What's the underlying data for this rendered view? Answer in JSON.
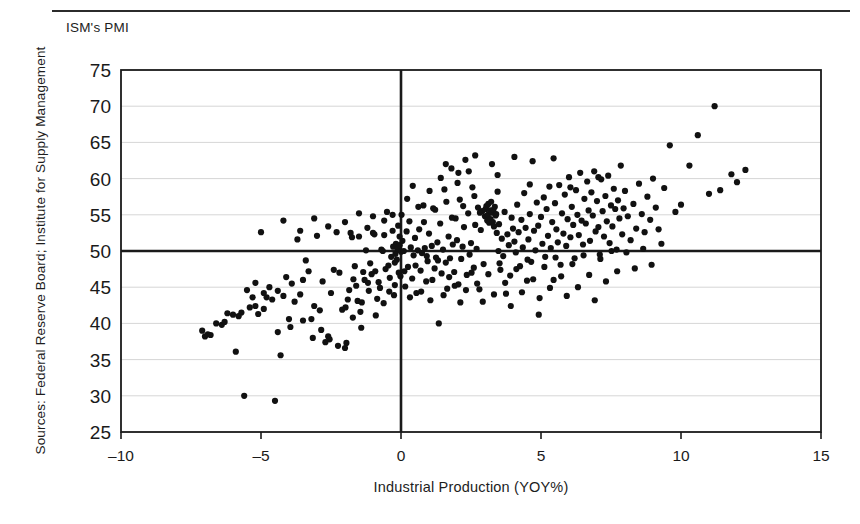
{
  "figure": {
    "y_axis_unit_label": "ISM's PMI",
    "source_note": "Sources: Federal Reserve Board; Institute for Supply Management",
    "ink_color": "#1a1a1a",
    "grid_color": "#d6d6d6",
    "point_color": "#111111"
  },
  "chart_data": {
    "type": "scatter",
    "title": "",
    "xlabel": "Industrial Production (YOY%)",
    "ylabel": "ISM's PMI",
    "xlim": [
      -10,
      15
    ],
    "ylim": [
      25,
      75
    ],
    "xticks": [
      -10,
      -5,
      0,
      5,
      10,
      15
    ],
    "xtick_labels": [
      "–10",
      "–5",
      "0",
      "5",
      "10",
      "15"
    ],
    "yticks": [
      25,
      30,
      35,
      40,
      45,
      50,
      55,
      60,
      65,
      70,
      75
    ],
    "ytick_labels": [
      "25",
      "30",
      "35",
      "40",
      "45",
      "50",
      "55",
      "60",
      "65",
      "70",
      "75"
    ],
    "grid": true,
    "grid_axis": "y",
    "legend": false,
    "reference_lines": [
      {
        "axis": "y",
        "value": 50,
        "style": "thick",
        "label": "PMI = 50 expansion threshold"
      },
      {
        "axis": "x",
        "value": 0,
        "style": "thick",
        "label": "Zero industrial production growth"
      }
    ],
    "marker": "filled-circle",
    "marker_size_px": 5,
    "n_points": 372,
    "points": [
      [
        -7.1,
        39.0
      ],
      [
        -7.0,
        38.2
      ],
      [
        -6.9,
        38.5
      ],
      [
        -6.6,
        40.0
      ],
      [
        -6.4,
        39.8
      ],
      [
        -6.2,
        41.4
      ],
      [
        -6.0,
        41.2
      ],
      [
        -5.9,
        36.1
      ],
      [
        -5.7,
        41.5
      ],
      [
        -5.6,
        30.0
      ],
      [
        -5.5,
        44.6
      ],
      [
        -5.4,
        42.2
      ],
      [
        -5.3,
        43.6
      ],
      [
        -5.2,
        45.6
      ],
      [
        -5.1,
        41.3
      ],
      [
        -5.0,
        52.6
      ],
      [
        -4.9,
        42.0
      ],
      [
        -4.8,
        43.6
      ],
      [
        -4.7,
        45.0
      ],
      [
        -4.6,
        43.3
      ],
      [
        -4.5,
        29.3
      ],
      [
        -4.4,
        44.5
      ],
      [
        -4.3,
        35.6
      ],
      [
        -4.2,
        43.8
      ],
      [
        -4.1,
        46.4
      ],
      [
        -4.0,
        40.6
      ],
      [
        -3.9,
        45.5
      ],
      [
        -3.8,
        43.0
      ],
      [
        -3.7,
        51.6
      ],
      [
        -3.6,
        44.0
      ],
      [
        -3.5,
        46.0
      ],
      [
        -3.4,
        48.7
      ],
      [
        -3.3,
        47.2
      ],
      [
        -3.2,
        40.6
      ],
      [
        -3.1,
        42.4
      ],
      [
        -3.0,
        52.1
      ],
      [
        -2.9,
        41.8
      ],
      [
        -2.8,
        45.8
      ],
      [
        -2.7,
        37.4
      ],
      [
        -2.6,
        38.2
      ],
      [
        -2.5,
        44.2
      ],
      [
        -2.4,
        47.4
      ],
      [
        -2.3,
        52.6
      ],
      [
        -2.2,
        47.0
      ],
      [
        -2.1,
        41.9
      ],
      [
        -2.0,
        36.6
      ],
      [
        -1.95,
        37.3
      ],
      [
        -1.9,
        43.3
      ],
      [
        -1.85,
        44.6
      ],
      [
        -1.8,
        52.5
      ],
      [
        -1.75,
        51.9
      ],
      [
        -1.7,
        46.1
      ],
      [
        -1.65,
        47.9
      ],
      [
        -1.6,
        45.2
      ],
      [
        -1.55,
        43.1
      ],
      [
        -1.5,
        52.0
      ],
      [
        -1.45,
        41.6
      ],
      [
        -1.4,
        42.9
      ],
      [
        -1.35,
        47.1
      ],
      [
        -1.3,
        46.0
      ],
      [
        -1.25,
        50.1
      ],
      [
        -1.2,
        53.2
      ],
      [
        -1.15,
        44.5
      ],
      [
        -1.1,
        48.3
      ],
      [
        -1.05,
        46.8
      ],
      [
        -1.0,
        52.5
      ],
      [
        -0.95,
        52.3
      ],
      [
        -0.9,
        41.1
      ],
      [
        -0.85,
        43.4
      ],
      [
        -0.8,
        45.7
      ],
      [
        -0.75,
        44.9
      ],
      [
        -0.7,
        50.2
      ],
      [
        -0.65,
        50.0
      ],
      [
        -0.6,
        52.2
      ],
      [
        -0.55,
        47.5
      ],
      [
        -0.5,
        55.4
      ],
      [
        -0.45,
        48.0
      ],
      [
        -0.4,
        46.3
      ],
      [
        -0.35,
        49.2
      ],
      [
        -0.3,
        52.8
      ],
      [
        -0.28,
        50.6
      ],
      [
        -0.25,
        43.9
      ],
      [
        -0.22,
        45.3
      ],
      [
        -0.2,
        49.6
      ],
      [
        -0.18,
        51.0
      ],
      [
        -0.15,
        48.8
      ],
      [
        -0.12,
        50.3
      ],
      [
        -0.1,
        53.5
      ],
      [
        -0.08,
        47.0
      ],
      [
        -0.05,
        50.8
      ],
      [
        -0.02,
        46.5
      ],
      [
        0.0,
        49.9
      ],
      [
        0.05,
        51.4
      ],
      [
        0.1,
        50.0
      ],
      [
        0.15,
        45.1
      ],
      [
        0.2,
        52.7
      ],
      [
        0.25,
        47.8
      ],
      [
        0.3,
        54.1
      ],
      [
        0.35,
        50.5
      ],
      [
        0.4,
        46.2
      ],
      [
        0.45,
        49.4
      ],
      [
        0.5,
        51.8
      ],
      [
        0.55,
        44.2
      ],
      [
        0.6,
        50.1
      ],
      [
        0.65,
        53.0
      ],
      [
        0.7,
        47.3
      ],
      [
        0.75,
        49.7
      ],
      [
        0.8,
        56.3
      ],
      [
        0.85,
        50.4
      ],
      [
        0.9,
        45.8
      ],
      [
        0.95,
        48.6
      ],
      [
        1.0,
        52.4
      ],
      [
        1.05,
        43.2
      ],
      [
        1.1,
        50.7
      ],
      [
        1.15,
        55.9
      ],
      [
        1.2,
        47.6
      ],
      [
        1.25,
        49.1
      ],
      [
        1.3,
        51.2
      ],
      [
        1.35,
        40.0
      ],
      [
        1.4,
        53.8
      ],
      [
        1.45,
        46.9
      ],
      [
        1.5,
        50.2
      ],
      [
        1.55,
        58.5
      ],
      [
        1.6,
        48.4
      ],
      [
        1.65,
        44.8
      ],
      [
        1.7,
        52.0
      ],
      [
        1.75,
        49.0
      ],
      [
        1.8,
        61.4
      ],
      [
        1.85,
        50.9
      ],
      [
        1.9,
        47.1
      ],
      [
        1.95,
        54.5
      ],
      [
        2.0,
        51.5
      ],
      [
        2.05,
        45.4
      ],
      [
        2.1,
        57.1
      ],
      [
        2.15,
        48.9
      ],
      [
        2.2,
        50.6
      ],
      [
        2.25,
        53.3
      ],
      [
        2.3,
        62.6
      ],
      [
        2.35,
        46.7
      ],
      [
        2.4,
        55.2
      ],
      [
        2.45,
        49.5
      ],
      [
        2.5,
        51.1
      ],
      [
        2.55,
        58.8
      ],
      [
        2.6,
        47.7
      ],
      [
        2.65,
        53.6
      ],
      [
        2.7,
        50.3
      ],
      [
        2.75,
        56.0
      ],
      [
        2.8,
        44.7
      ],
      [
        2.85,
        52.9
      ],
      [
        2.9,
        55.5
      ],
      [
        2.95,
        48.2
      ],
      [
        3.0,
        54.8
      ],
      [
        3.02,
        55.8
      ],
      [
        3.05,
        56.2
      ],
      [
        3.08,
        54.2
      ],
      [
        3.1,
        55.0
      ],
      [
        3.12,
        56.5
      ],
      [
        3.15,
        53.9
      ],
      [
        3.18,
        55.6
      ],
      [
        3.2,
        54.4
      ],
      [
        3.22,
        56.8
      ],
      [
        3.25,
        55.3
      ],
      [
        3.28,
        54.0
      ],
      [
        3.3,
        55.7
      ],
      [
        3.32,
        53.4
      ],
      [
        3.35,
        56.1
      ],
      [
        3.38,
        54.9
      ],
      [
        3.4,
        55.1
      ],
      [
        3.42,
        52.5
      ],
      [
        3.45,
        58.2
      ],
      [
        3.48,
        50.0
      ],
      [
        3.5,
        53.7
      ],
      [
        3.55,
        47.4
      ],
      [
        3.6,
        51.7
      ],
      [
        3.65,
        49.3
      ],
      [
        3.7,
        55.4
      ],
      [
        3.75,
        44.1
      ],
      [
        3.8,
        52.3
      ],
      [
        3.85,
        50.8
      ],
      [
        3.9,
        46.6
      ],
      [
        3.95,
        54.6
      ],
      [
        4.0,
        53.1
      ],
      [
        4.05,
        51.3
      ],
      [
        4.1,
        49.8
      ],
      [
        4.15,
        56.4
      ],
      [
        4.2,
        52.6
      ],
      [
        4.25,
        47.9
      ],
      [
        4.3,
        54.3
      ],
      [
        4.35,
        50.5
      ],
      [
        4.4,
        58.0
      ],
      [
        4.45,
        53.2
      ],
      [
        4.5,
        45.9
      ],
      [
        4.55,
        51.6
      ],
      [
        4.6,
        55.1
      ],
      [
        4.65,
        48.5
      ],
      [
        4.7,
        62.4
      ],
      [
        4.75,
        52.8
      ],
      [
        4.8,
        50.1
      ],
      [
        4.85,
        56.7
      ],
      [
        4.9,
        53.5
      ],
      [
        4.95,
        43.5
      ],
      [
        5.0,
        54.7
      ],
      [
        5.05,
        51.0
      ],
      [
        5.1,
        57.4
      ],
      [
        5.15,
        49.2
      ],
      [
        5.2,
        55.8
      ],
      [
        5.25,
        52.1
      ],
      [
        5.3,
        58.9
      ],
      [
        5.35,
        50.4
      ],
      [
        5.4,
        54.0
      ],
      [
        5.45,
        46.0
      ],
      [
        5.5,
        56.6
      ],
      [
        5.55,
        53.0
      ],
      [
        5.6,
        51.2
      ],
      [
        5.65,
        59.1
      ],
      [
        5.7,
        48.1
      ],
      [
        5.75,
        55.2
      ],
      [
        5.8,
        52.4
      ],
      [
        5.85,
        57.8
      ],
      [
        5.9,
        50.7
      ],
      [
        5.95,
        54.4
      ],
      [
        6.0,
        60.2
      ],
      [
        6.05,
        51.9
      ],
      [
        6.1,
        56.1
      ],
      [
        6.15,
        53.6
      ],
      [
        6.2,
        49.0
      ],
      [
        6.25,
        58.4
      ],
      [
        6.3,
        55.0
      ],
      [
        6.35,
        52.2
      ],
      [
        6.4,
        60.8
      ],
      [
        6.45,
        54.2
      ],
      [
        6.5,
        50.9
      ],
      [
        6.55,
        57.2
      ],
      [
        6.6,
        53.8
      ],
      [
        6.65,
        59.6
      ],
      [
        6.7,
        55.6
      ],
      [
        6.75,
        51.4
      ],
      [
        6.8,
        58.1
      ],
      [
        6.85,
        54.9
      ],
      [
        6.9,
        61.0
      ],
      [
        6.95,
        52.7
      ],
      [
        7.0,
        56.9
      ],
      [
        7.05,
        53.3
      ],
      [
        7.1,
        49.5
      ],
      [
        7.15,
        59.9
      ],
      [
        7.2,
        55.5
      ],
      [
        7.25,
        52.0
      ],
      [
        7.3,
        57.6
      ],
      [
        7.35,
        54.1
      ],
      [
        7.4,
        60.4
      ],
      [
        7.45,
        51.1
      ],
      [
        7.5,
        56.3
      ],
      [
        7.55,
        53.4
      ],
      [
        7.6,
        58.6
      ],
      [
        7.65,
        55.8
      ],
      [
        7.7,
        50.2
      ],
      [
        7.75,
        57.0
      ],
      [
        7.8,
        54.5
      ],
      [
        7.85,
        61.8
      ],
      [
        7.9,
        52.3
      ],
      [
        7.95,
        55.9
      ],
      [
        8.0,
        58.3
      ],
      [
        8.1,
        54.8
      ],
      [
        8.2,
        51.5
      ],
      [
        8.3,
        56.5
      ],
      [
        8.4,
        53.1
      ],
      [
        8.5,
        59.3
      ],
      [
        8.6,
        55.1
      ],
      [
        8.7,
        52.6
      ],
      [
        8.8,
        57.5
      ],
      [
        8.9,
        54.3
      ],
      [
        9.0,
        60.0
      ],
      [
        9.1,
        56.0
      ],
      [
        9.2,
        53.0
      ],
      [
        9.4,
        58.7
      ],
      [
        9.6,
        64.6
      ],
      [
        9.8,
        55.4
      ],
      [
        10.0,
        56.4
      ],
      [
        10.3,
        61.8
      ],
      [
        10.6,
        66.0
      ],
      [
        11.0,
        57.9
      ],
      [
        11.2,
        70.0
      ],
      [
        11.4,
        58.4
      ],
      [
        11.8,
        60.6
      ],
      [
        12.0,
        59.5
      ],
      [
        12.3,
        61.2
      ],
      [
        -6.8,
        38.4
      ],
      [
        -6.3,
        40.2
      ],
      [
        -5.8,
        41.0
      ],
      [
        -5.2,
        42.4
      ],
      [
        -4.9,
        44.2
      ],
      [
        -4.4,
        38.8
      ],
      [
        -3.95,
        39.5
      ],
      [
        -3.5,
        40.4
      ],
      [
        -3.15,
        38.0
      ],
      [
        -2.85,
        39.1
      ],
      [
        -2.55,
        37.8
      ],
      [
        -2.25,
        36.9
      ],
      [
        -1.98,
        42.2
      ],
      [
        -1.72,
        40.8
      ],
      [
        -1.42,
        39.4
      ],
      [
        -1.18,
        45.6
      ],
      [
        -0.92,
        47.2
      ],
      [
        -0.62,
        42.8
      ],
      [
        -0.42,
        44.4
      ],
      [
        -0.22,
        48.4
      ],
      [
        0.12,
        47.2
      ],
      [
        0.32,
        43.6
      ],
      [
        0.52,
        48.0
      ],
      [
        0.72,
        44.4
      ],
      [
        0.92,
        49.3
      ],
      [
        1.12,
        46.0
      ],
      [
        1.32,
        48.7
      ],
      [
        1.52,
        43.9
      ],
      [
        1.72,
        46.4
      ],
      [
        1.92,
        45.2
      ],
      [
        2.12,
        42.9
      ],
      [
        2.32,
        44.6
      ],
      [
        2.52,
        47.0
      ],
      [
        2.72,
        45.5
      ],
      [
        2.92,
        43.0
      ],
      [
        3.12,
        46.8
      ],
      [
        3.32,
        44.0
      ],
      [
        3.52,
        48.3
      ],
      [
        3.72,
        45.6
      ],
      [
        3.92,
        42.4
      ],
      [
        4.12,
        47.5
      ],
      [
        4.32,
        44.3
      ],
      [
        4.52,
        48.8
      ],
      [
        4.72,
        46.1
      ],
      [
        4.92,
        41.2
      ],
      [
        5.12,
        47.8
      ],
      [
        5.32,
        44.9
      ],
      [
        5.52,
        49.1
      ],
      [
        5.72,
        46.5
      ],
      [
        5.92,
        43.8
      ],
      [
        6.12,
        48.2
      ],
      [
        6.32,
        45.0
      ],
      [
        6.52,
        49.4
      ],
      [
        6.72,
        46.7
      ],
      [
        6.92,
        43.2
      ],
      [
        7.12,
        48.9
      ],
      [
        7.32,
        45.8
      ],
      [
        7.52,
        50.0
      ],
      [
        7.72,
        47.2
      ],
      [
        8.05,
        49.8
      ],
      [
        8.35,
        47.6
      ],
      [
        8.65,
        50.3
      ],
      [
        8.95,
        48.1
      ],
      [
        9.3,
        51.0
      ],
      [
        0.02,
        55.0
      ],
      [
        0.22,
        57.2
      ],
      [
        0.42,
        59.0
      ],
      [
        0.62,
        56.1
      ],
      [
        0.82,
        54.0
      ],
      [
        1.02,
        58.3
      ],
      [
        1.22,
        55.7
      ],
      [
        1.42,
        60.1
      ],
      [
        1.62,
        56.8
      ],
      [
        1.82,
        54.6
      ],
      [
        2.02,
        59.4
      ],
      [
        2.22,
        56.2
      ],
      [
        2.42,
        61.0
      ],
      [
        2.62,
        57.6
      ],
      [
        2.82,
        55.3
      ],
      [
        -0.05,
        52.0
      ],
      [
        -0.3,
        55.0
      ],
      [
        -0.6,
        54.2
      ],
      [
        -1.0,
        54.8
      ],
      [
        -1.5,
        55.2
      ],
      [
        -2.0,
        54.0
      ],
      [
        -2.6,
        53.4
      ],
      [
        -3.1,
        54.5
      ],
      [
        -3.6,
        52.8
      ],
      [
        -4.2,
        54.2
      ],
      [
        4.05,
        63.0
      ],
      [
        3.25,
        62.0
      ],
      [
        2.65,
        63.2
      ],
      [
        1.6,
        62.0
      ],
      [
        5.45,
        62.8
      ],
      [
        3.45,
        60.5
      ],
      [
        4.6,
        59.2
      ],
      [
        2.05,
        60.8
      ],
      [
        6.05,
        58.8
      ],
      [
        7.05,
        60.2
      ]
    ]
  }
}
